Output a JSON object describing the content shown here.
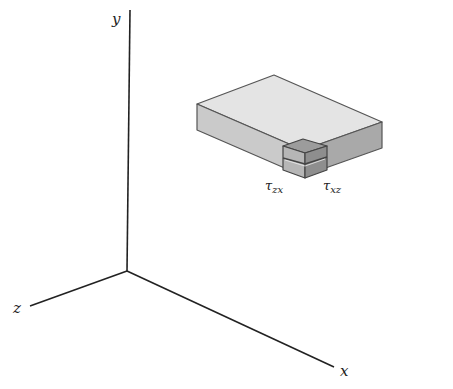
{
  "axes": {
    "x": {
      "label": "x"
    },
    "y": {
      "label": "y"
    },
    "z": {
      "label": "z"
    }
  },
  "stress_labels": [
    {
      "symbol": "τ",
      "subscript": "zx"
    },
    {
      "symbol": "τ",
      "subscript": "xz"
    }
  ],
  "colors": {
    "axis": "#222222",
    "box_top": "#e4e4e4",
    "box_left": "#c8c8c8",
    "box_right": "#a8a8a8",
    "cube_top": "#9a9a9a",
    "cube_left": "#b4b4b4",
    "cube_right": "#8c8c8c",
    "edge": "#555555"
  }
}
